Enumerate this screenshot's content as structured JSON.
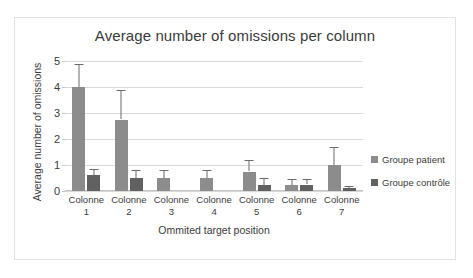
{
  "chart_data": {
    "type": "bar",
    "title": "Average number of omissions per column",
    "xlabel": "Ommited target position",
    "ylabel": "Average number of omissions",
    "ylim": [
      0,
      5
    ],
    "yticks": [
      0,
      1,
      2,
      3,
      4,
      5
    ],
    "grid": true,
    "legend_position": "right",
    "categories": [
      "Colonne 1",
      "Colonne 2",
      "Colonne 3",
      "Colonne 4",
      "Colonne 5",
      "Colonne 6",
      "Colonne 7"
    ],
    "category_lines": [
      {
        "word": "Colonne",
        "number": "1"
      },
      {
        "word": "Colonne",
        "number": "2"
      },
      {
        "word": "Colonne",
        "number": "3"
      },
      {
        "word": "Colonne",
        "number": "4"
      },
      {
        "word": "Colonne",
        "number": "5"
      },
      {
        "word": "Colonne",
        "number": "6"
      },
      {
        "word": "Colonne",
        "number": "7"
      }
    ],
    "series": [
      {
        "name": "Groupe patient",
        "color": "#8c8c8c",
        "values": [
          4.0,
          2.75,
          0.5,
          0.5,
          0.75,
          0.22,
          1.0
        ],
        "errors_upper": [
          0.9,
          1.15,
          0.3,
          0.3,
          0.45,
          0.25,
          0.7
        ]
      },
      {
        "name": "Groupe contrôle",
        "color": "#616161",
        "values": [
          0.6,
          0.5,
          0.0,
          0.0,
          0.25,
          0.25,
          0.1
        ],
        "errors_upper": [
          0.25,
          0.3,
          0.0,
          0.0,
          0.25,
          0.2,
          0.1
        ]
      }
    ]
  },
  "legend": {
    "items": [
      {
        "label": "Groupe patient"
      },
      {
        "label": "Groupe contrôle"
      }
    ]
  },
  "colors": {
    "patient": "#8c8c8c",
    "control": "#616161",
    "grid": "#d9d9d9",
    "text": "#3b3b3b",
    "frame": "#e2e2e2"
  }
}
